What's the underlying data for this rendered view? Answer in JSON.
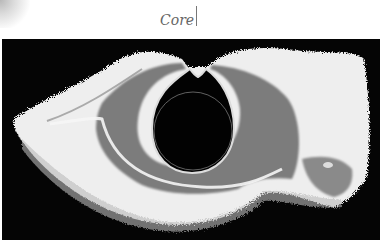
{
  "figure": {
    "label": "Core",
    "colors": {
      "background": "#050505",
      "outer_layer": "#f2f2f2",
      "mid_layer": "#7a7a7a",
      "ring_edge": "#dddddd",
      "label_text": "#666666"
    }
  }
}
